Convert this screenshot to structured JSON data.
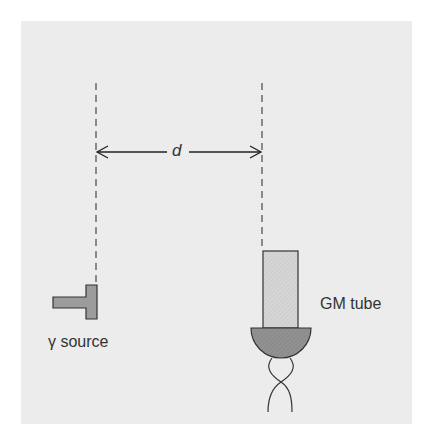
{
  "diagram": {
    "distance_label": "d",
    "source_label": "γ source",
    "detector_label": "GM tube",
    "colors": {
      "panel_background": "#ececec",
      "source_fill": "#9c9c9c",
      "tube_fill": "#d6d6d6",
      "window_fill": "#8e8e8e",
      "stroke": "#333333",
      "dash": "#555555"
    }
  }
}
